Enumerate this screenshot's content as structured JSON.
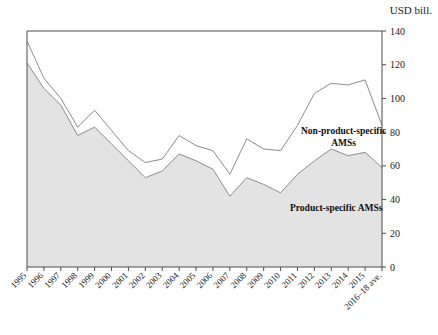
{
  "chart_data": {
    "type": "area",
    "stacked": true,
    "title": "",
    "subtitle": "",
    "xlabel": "",
    "ylabel": "USD bill.",
    "unit_label": "USD bill.",
    "ylim": [
      0,
      140
    ],
    "ytick_values": [
      0,
      20,
      40,
      60,
      80,
      100,
      120,
      140
    ],
    "ytick_labels": [
      "0",
      "20",
      "40",
      "60",
      "80",
      "100",
      "120",
      "140"
    ],
    "yaxis_position": "right",
    "grid": false,
    "legend_position": "inline-annotation",
    "categories": [
      "1995",
      "1996",
      "1997",
      "1998",
      "1999",
      "2000",
      "2001",
      "2002",
      "2003",
      "2004",
      "2005",
      "2006",
      "2007",
      "2008",
      "2009",
      "2010",
      "2011",
      "2012",
      "2013",
      "2014",
      "2015",
      "2016–18 ave."
    ],
    "series": [
      {
        "name": "Product-specific AMSs",
        "fill_color": "#e3e3e3",
        "line_color": "#8c8c8c",
        "values": [
          121,
          106,
          96,
          78,
          83,
          73,
          63,
          53,
          57,
          67,
          63,
          58,
          42,
          53,
          49,
          44,
          55,
          63,
          70,
          66,
          68,
          59
        ]
      },
      {
        "name": "Non-product-specific AMSs",
        "fill_color": "#ffffff",
        "line_color": "#8c8c8c",
        "values": [
          13,
          6,
          4,
          5,
          10,
          8,
          6,
          9,
          7,
          11,
          9,
          11,
          13,
          23,
          21,
          25,
          29,
          40,
          39,
          42,
          43,
          25
        ]
      }
    ],
    "totals": [
      134,
      112,
      100,
      83,
      93,
      81,
      69,
      62,
      64,
      78,
      72,
      69,
      55,
      76,
      70,
      69,
      84,
      103,
      109,
      108,
      111,
      84
    ],
    "annotations": [
      {
        "text": "Non-product-specific AMSs",
        "lines": [
          "Non-product-specific",
          "AMSs"
        ]
      },
      {
        "text": "Product-specific AMSs",
        "lines": [
          "Product-specific AMSs"
        ]
      }
    ]
  },
  "colors": {
    "axis": "#4d4d4d",
    "line": "#8c8c8c",
    "area_fill": "#e3e3e3",
    "text": "#1a1a1a",
    "background": "#ffffff"
  }
}
